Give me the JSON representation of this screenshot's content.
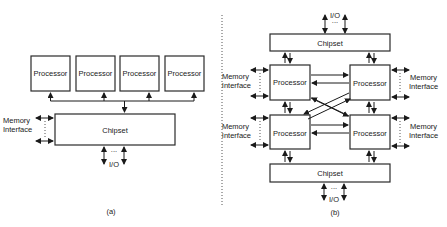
{
  "figure": {
    "panel_a": {
      "caption": "(a)",
      "processors": [
        "Processor",
        "Processor",
        "Processor",
        "Processor"
      ],
      "chipset": "Chipset",
      "memory_interface": [
        "Memory",
        "Interface"
      ],
      "io": "I/O",
      "ellipsis": "..."
    },
    "panel_b": {
      "caption": "(b)",
      "top_chipset": "Chipset",
      "bottom_chipset": "Chipset",
      "processors": [
        "Processor",
        "Processor",
        "Processor",
        "Processor"
      ],
      "memory_interface": [
        "Memory",
        "Interface"
      ],
      "io_top": "I/O",
      "io_bottom": "I/O",
      "ellipsis": "..."
    }
  }
}
